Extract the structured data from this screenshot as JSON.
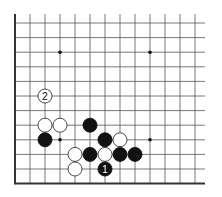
{
  "diagram": {
    "type": "go-board-fragment",
    "grid": {
      "columns": 13,
      "rows": 12,
      "left_edge": true,
      "bottom_edge": true,
      "origin_x": 15,
      "origin_y": 23,
      "spacing_x": 15,
      "spacing_y": 14.6,
      "line_color": "#555555",
      "edge_color": "#333333"
    },
    "star_points": [
      {
        "c": 3,
        "r": 2
      },
      {
        "c": 9,
        "r": 2
      },
      {
        "c": 3,
        "r": 8
      },
      {
        "c": 9,
        "r": 8
      }
    ],
    "stones": [
      {
        "c": 2,
        "r": 5,
        "color": "white",
        "label": "2"
      },
      {
        "c": 2,
        "r": 7,
        "color": "white",
        "label": ""
      },
      {
        "c": 3,
        "r": 7,
        "color": "white",
        "label": ""
      },
      {
        "c": 5,
        "r": 7,
        "color": "black",
        "label": ""
      },
      {
        "c": 2,
        "r": 8,
        "color": "black",
        "label": ""
      },
      {
        "c": 6,
        "r": 8,
        "color": "black",
        "label": ""
      },
      {
        "c": 7,
        "r": 8,
        "color": "white",
        "label": ""
      },
      {
        "c": 4,
        "r": 9,
        "color": "white",
        "label": ""
      },
      {
        "c": 5,
        "r": 9,
        "color": "black",
        "label": ""
      },
      {
        "c": 6,
        "r": 9,
        "color": "white",
        "label": ""
      },
      {
        "c": 7,
        "r": 9,
        "color": "black",
        "label": ""
      },
      {
        "c": 8,
        "r": 9,
        "color": "black",
        "label": ""
      },
      {
        "c": 4,
        "r": 10,
        "color": "white",
        "label": ""
      },
      {
        "c": 6,
        "r": 10,
        "color": "black",
        "label": "1"
      }
    ],
    "colors": {
      "black_stone": "#111111",
      "white_stone": "#ffffff",
      "white_stone_border": "#333333",
      "label_on_black": "#ffffff",
      "label_on_white": "#111111"
    }
  }
}
